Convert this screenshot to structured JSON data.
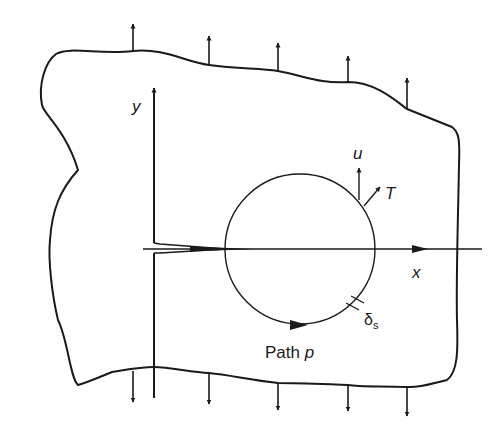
{
  "diagram": {
    "labels": {
      "y_axis": "y",
      "x_axis": "x",
      "displacement": "u",
      "traction": "T",
      "path_prefix": "Path ",
      "path_var": "p",
      "segment_main": "δ",
      "segment_sub": "s"
    },
    "load_arrows": {
      "top_count": 5,
      "bottom_count": 5,
      "direction_top": "up",
      "direction_bottom": "down"
    },
    "colors": {
      "line": "#1a1a1a",
      "background": "#ffffff"
    }
  }
}
